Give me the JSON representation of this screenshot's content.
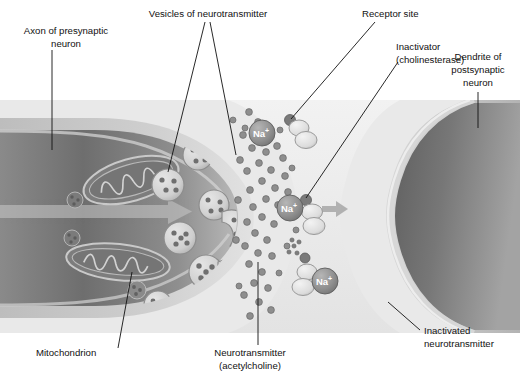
{
  "figure": {
    "panel_background": "#e9e9e9",
    "ink_color": "#111111"
  },
  "labels": {
    "axon": "Axon of presynaptic\nneuron",
    "axon_line1": "Axon of presynaptic",
    "axon_line2": "neuron",
    "vesicles": "Vesicles of neurotransmitter",
    "receptor": "Receptor site",
    "inactivator_line1": "Inactivator",
    "inactivator_line2": "(cholinesterase)",
    "dendrite_line1": "Dendrite of",
    "dendrite_line2": "postsynaptic",
    "dendrite_line3": "neuron",
    "mitochondrion": "Mitochondrion",
    "neurotransmitter_line1": "Neurotransmitter",
    "neurotransmitter_line2": "(acetylcholine)",
    "inactivated_line1": "Inactivated",
    "inactivated_line2": "neurotransmitter"
  },
  "ions": [
    {
      "id": "na-1",
      "text": "Na",
      "charge": "+",
      "x": 262,
      "y": 133,
      "r": 13
    },
    {
      "id": "na-2",
      "text": "Na",
      "charge": "+",
      "x": 290,
      "y": 208,
      "r": 13
    },
    {
      "id": "na-3",
      "text": "Na",
      "charge": "+",
      "x": 325,
      "y": 281,
      "r": 13
    }
  ],
  "colors": {
    "panel_bg": "#e9e9e9",
    "axon_cytoplasm_dark": "#6e6e6e",
    "axon_membrane_light": "#d8d8d8",
    "dendrite_dark": "#6a6a6a",
    "dendrite_mid": "#8d8d8d",
    "cleft": "#ededed",
    "vesicle_fill": "#d5d5d5",
    "vesicle_dot": "#707070",
    "ion_fill": "#909090",
    "ion_text": "#ffffff",
    "transmitter_dot": "#8a8a8a"
  },
  "structures": {
    "mitochondria_count": 2,
    "vesicle_count": 12,
    "fusing_vesicle_count": 3,
    "receptor_site_count": 3,
    "transmitter_dot_count": 46,
    "flow_arrow": "rightward arrow in axon cytoplasm"
  }
}
